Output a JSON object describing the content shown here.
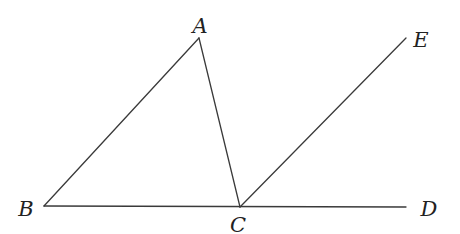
{
  "diagram": {
    "type": "geometry",
    "points": {
      "A": {
        "label": "A",
        "x": 199,
        "y": 38,
        "lx": 200,
        "ly": 33
      },
      "B": {
        "label": "B",
        "x": 44,
        "y": 206,
        "lx": 26,
        "ly": 216
      },
      "C": {
        "label": "C",
        "x": 240,
        "y": 207,
        "lx": 238,
        "ly": 232
      },
      "D": {
        "label": "D",
        "x": 406,
        "y": 207,
        "lx": 429,
        "ly": 216
      },
      "E": {
        "label": "E",
        "x": 406,
        "y": 38,
        "lx": 421,
        "ly": 47
      }
    },
    "segments": [
      [
        "B",
        "A"
      ],
      [
        "A",
        "C"
      ],
      [
        "B",
        "D"
      ],
      [
        "C",
        "E"
      ]
    ],
    "colors": {
      "line": "#3a3a3a",
      "text": "#222222",
      "background": "#ffffff"
    }
  }
}
